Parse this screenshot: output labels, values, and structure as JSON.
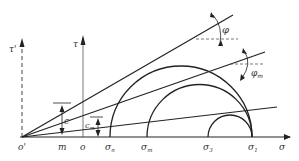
{
  "diagram": {
    "type": "Mohr circle failure envelope",
    "axes": {
      "sigma_label": "σ",
      "tau_label": "τ",
      "tau_prime_label": "τ'"
    },
    "points": {
      "o_prime": "o'",
      "m": "m",
      "o": "o",
      "sigma_n": "σ",
      "sigma_n_sub": "n",
      "sigma_m": "σ",
      "sigma_m_sub": "m",
      "sigma_3": "σ",
      "sigma_3_sub": "3",
      "sigma_1": "σ",
      "sigma_1_sub": "1"
    },
    "annotations": {
      "c": "c",
      "c_m": "c",
      "c_m_sub": "m",
      "phi": "φ",
      "phi_m": "φ",
      "phi_m_sub": "m"
    },
    "colors": {
      "stroke": "#222222",
      "dash": "#555555"
    }
  }
}
